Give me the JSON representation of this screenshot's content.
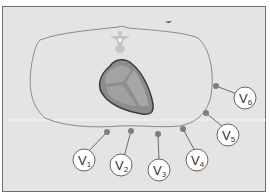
{
  "diagram": {
    "colors": {
      "background": "#e4e4e4",
      "frame_border": "#6e6e6e",
      "thorax_outline": "#8a8a8a",
      "heart_fill": "#8d8d8d",
      "heart_outline": "#3a3a3a",
      "heart_inner": "#a3a3a3",
      "electrode": "#7d7d7d",
      "label_circle_fill": "#ffffff",
      "label_circle_stroke": "#555555"
    },
    "leads": [
      {
        "id": "V1",
        "letter": "V",
        "sub": "1"
      },
      {
        "id": "V2",
        "letter": "V",
        "sub": "2"
      },
      {
        "id": "V3",
        "letter": "V",
        "sub": "3"
      },
      {
        "id": "V4",
        "letter": "V",
        "sub": "4"
      },
      {
        "id": "V5",
        "letter": "V",
        "sub": "5"
      },
      {
        "id": "V6",
        "letter": "V",
        "sub": "6"
      }
    ]
  }
}
